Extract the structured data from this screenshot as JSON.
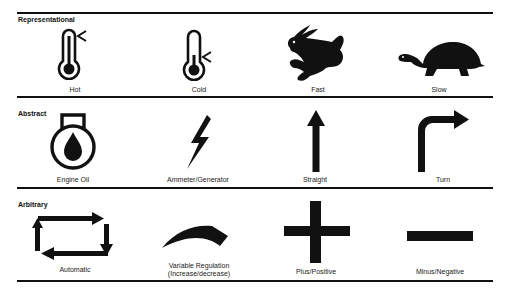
{
  "sections": [
    {
      "title": "Representational",
      "items": [
        {
          "label": "Hot",
          "icon": "thermometer-hot-icon"
        },
        {
          "label": "Cold",
          "icon": "thermometer-cold-icon"
        },
        {
          "label": "Fast",
          "icon": "rabbit-icon"
        },
        {
          "label": "Slow",
          "icon": "turtle-icon"
        }
      ]
    },
    {
      "title": "Abstract",
      "items": [
        {
          "label": "Engine Oil",
          "icon": "oil-drop-icon"
        },
        {
          "label": "Ammeter/Generator",
          "icon": "lightning-bolt-icon"
        },
        {
          "label": "Straight",
          "icon": "arrow-up-icon"
        },
        {
          "label": "Turn",
          "icon": "arrow-turn-right-icon"
        }
      ]
    },
    {
      "title": "Arbitrary",
      "items": [
        {
          "label": "Automatic",
          "icon": "cycle-arrows-icon"
        },
        {
          "label_line1": "Variable Regulation",
          "label_line2": "(Increase/decrease)",
          "icon": "wedge-arc-icon"
        },
        {
          "label": "Plus/Positive",
          "icon": "plus-icon"
        },
        {
          "label": "Minus/Negative",
          "icon": "minus-icon"
        }
      ]
    }
  ],
  "colors": {
    "ink": "#111111",
    "background": "#ffffff"
  }
}
